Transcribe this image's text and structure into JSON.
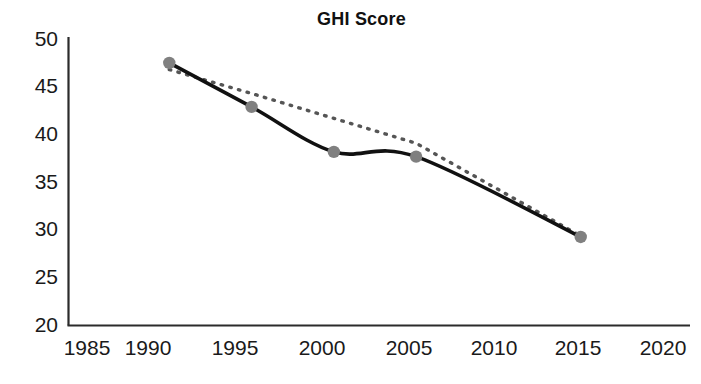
{
  "chart_data": {
    "type": "line",
    "title": "GHI Score",
    "xlabel": "",
    "ylabel": "",
    "xlim": [
      1985,
      2020
    ],
    "ylim": [
      20,
      50
    ],
    "grid": false,
    "legend": "none",
    "x_ticks": [
      "1985",
      "1990",
      "1995",
      "2000",
      "2005",
      "2010",
      "2015",
      "2020"
    ],
    "y_ticks": [
      "20",
      "25",
      "30",
      "35",
      "40",
      "45",
      "50"
    ],
    "x": [
      1990,
      1995,
      2000,
      2005,
      2015
    ],
    "series": [
      {
        "name": "GHI Score",
        "style": "solid-smooth-with-markers",
        "color": "#111111",
        "marker_color": "#808080",
        "values": [
          47.4,
          42.8,
          38.1,
          37.6,
          29.2
        ]
      },
      {
        "name": "Trend",
        "style": "dotted",
        "color": "#555555",
        "values": [
          46.7,
          44.2,
          41.6,
          39.0,
          29.3
        ]
      }
    ]
  }
}
